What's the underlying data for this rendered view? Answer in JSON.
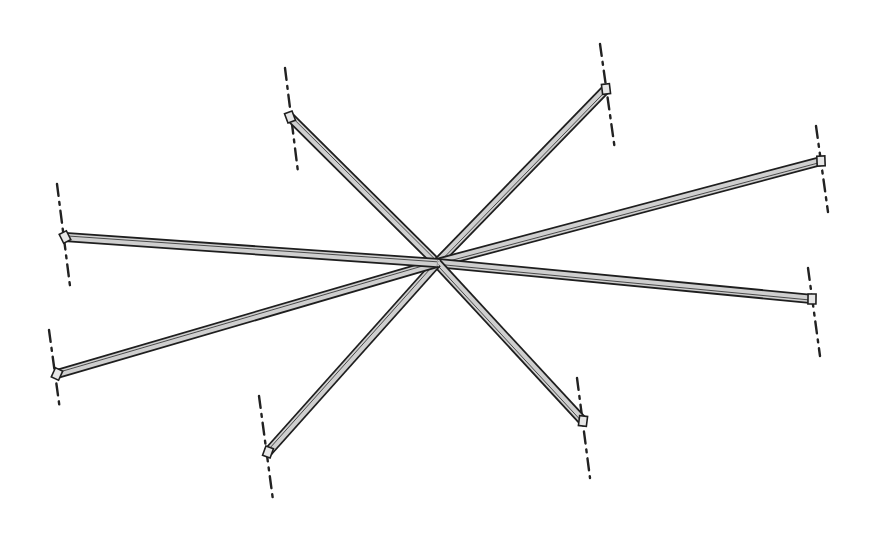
{
  "diagram": {
    "title": "",
    "colors": {
      "background": "#ffffff",
      "outline": "#1e1e1e",
      "fill": "#cfcfcf",
      "axis": "#222222"
    },
    "center": {
      "x": 437,
      "y": 263
    },
    "beam_width": 10,
    "beams": [
      {
        "id": "upper-left",
        "end": {
          "x": 290,
          "y": 117
        },
        "axis": {
          "x1": 285,
          "y1": 68,
          "x2": 298,
          "y2": 172
        }
      },
      {
        "id": "upper-right",
        "end": {
          "x": 606,
          "y": 89
        },
        "axis": {
          "x1": 600,
          "y1": 44,
          "x2": 615,
          "y2": 150
        }
      },
      {
        "id": "right-upper",
        "end": {
          "x": 821,
          "y": 161
        },
        "axis": {
          "x1": 816,
          "y1": 126,
          "x2": 828,
          "y2": 212
        }
      },
      {
        "id": "right-lower",
        "end": {
          "x": 812,
          "y": 299
        },
        "axis": {
          "x1": 808,
          "y1": 268,
          "x2": 820,
          "y2": 356
        }
      },
      {
        "id": "lower-right",
        "end": {
          "x": 583,
          "y": 421
        },
        "axis": {
          "x1": 577,
          "y1": 378,
          "x2": 590,
          "y2": 478
        }
      },
      {
        "id": "lower-left",
        "end": {
          "x": 268,
          "y": 452
        },
        "axis": {
          "x1": 259,
          "y1": 396,
          "x2": 273,
          "y2": 500
        }
      },
      {
        "id": "left-lower",
        "end": {
          "x": 57,
          "y": 374
        },
        "axis": {
          "x1": 49,
          "y1": 330,
          "x2": 60,
          "y2": 410
        }
      },
      {
        "id": "left-upper",
        "end": {
          "x": 65,
          "y": 237
        },
        "axis": {
          "x1": 57,
          "y1": 184,
          "x2": 70,
          "y2": 286
        }
      }
    ]
  }
}
